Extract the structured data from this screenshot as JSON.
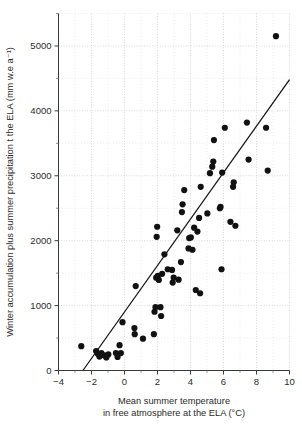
{
  "chart_data": {
    "type": "scatter",
    "title": "",
    "subtitle": "",
    "xlabel": "Mean summer temperature in free atmosphere at the ELA (°C)",
    "xlabel_line1": "Mean summer temperature",
    "xlabel_line2": "in free atmosphere at the ELA (°C)",
    "ylabel": "Winter accumulation plus summer precipitation t the ELA (mm w.e a⁻¹)",
    "xlim": [
      -4,
      10
    ],
    "ylim": [
      0,
      5500
    ],
    "x_ticks": [
      -4,
      -2,
      0,
      2,
      4,
      6,
      8,
      10
    ],
    "x_tick_labels": [
      "−4",
      "−2",
      "0",
      "2",
      "4",
      "6",
      "8",
      "10"
    ],
    "x_minor_ticks": [
      -3,
      -1,
      1,
      3,
      5,
      7,
      9
    ],
    "y_ticks": [
      0,
      1000,
      2000,
      3000,
      4000,
      5000
    ],
    "y_tick_labels": [
      "0",
      "1000",
      "2000",
      "3000",
      "4000",
      "5000"
    ],
    "y_minor_ticks": [
      500,
      1500,
      2500,
      3500,
      4500,
      5500
    ],
    "grid": true,
    "grid_style": "dotted",
    "legend": "none",
    "marker": "filled-circle",
    "marker_color": "#111111",
    "marker_size_px": 3.1,
    "points": [
      {
        "x": -2.62,
        "y": 375
      },
      {
        "x": -1.72,
        "y": 300
      },
      {
        "x": -1.62,
        "y": 258
      },
      {
        "x": -1.52,
        "y": 215
      },
      {
        "x": -1.4,
        "y": 268
      },
      {
        "x": -1.22,
        "y": 232
      },
      {
        "x": -1.1,
        "y": 200
      },
      {
        "x": -0.98,
        "y": 248
      },
      {
        "x": -0.52,
        "y": 268
      },
      {
        "x": -0.42,
        "y": 208
      },
      {
        "x": -0.3,
        "y": 390
      },
      {
        "x": -0.22,
        "y": 268
      },
      {
        "x": -0.12,
        "y": 745
      },
      {
        "x": 0.6,
        "y": 655
      },
      {
        "x": 0.62,
        "y": 560
      },
      {
        "x": 0.68,
        "y": 1300
      },
      {
        "x": 1.12,
        "y": 490
      },
      {
        "x": 1.78,
        "y": 560
      },
      {
        "x": 1.82,
        "y": 905
      },
      {
        "x": 1.88,
        "y": 975
      },
      {
        "x": 1.92,
        "y": 1430
      },
      {
        "x": 1.95,
        "y": 2060
      },
      {
        "x": 1.98,
        "y": 2215
      },
      {
        "x": 2.02,
        "y": 1460
      },
      {
        "x": 2.08,
        "y": 1395
      },
      {
        "x": 2.18,
        "y": 975
      },
      {
        "x": 2.22,
        "y": 840
      },
      {
        "x": 2.28,
        "y": 1490
      },
      {
        "x": 2.42,
        "y": 1790
      },
      {
        "x": 2.62,
        "y": 1560
      },
      {
        "x": 2.88,
        "y": 1550
      },
      {
        "x": 2.92,
        "y": 1355
      },
      {
        "x": 2.98,
        "y": 1430
      },
      {
        "x": 3.2,
        "y": 2160
      },
      {
        "x": 3.28,
        "y": 1400
      },
      {
        "x": 3.42,
        "y": 1670
      },
      {
        "x": 3.48,
        "y": 2440
      },
      {
        "x": 3.52,
        "y": 2560
      },
      {
        "x": 3.62,
        "y": 2780
      },
      {
        "x": 3.88,
        "y": 1880
      },
      {
        "x": 3.92,
        "y": 2040
      },
      {
        "x": 4.02,
        "y": 2050
      },
      {
        "x": 4.12,
        "y": 1860
      },
      {
        "x": 4.22,
        "y": 2200
      },
      {
        "x": 4.32,
        "y": 1240
      },
      {
        "x": 4.42,
        "y": 2140
      },
      {
        "x": 4.52,
        "y": 2350
      },
      {
        "x": 4.58,
        "y": 1190
      },
      {
        "x": 4.62,
        "y": 2830
      },
      {
        "x": 5.02,
        "y": 2420
      },
      {
        "x": 5.18,
        "y": 3040
      },
      {
        "x": 5.32,
        "y": 3140
      },
      {
        "x": 5.38,
        "y": 3220
      },
      {
        "x": 5.42,
        "y": 3550
      },
      {
        "x": 5.78,
        "y": 2500
      },
      {
        "x": 5.82,
        "y": 2520
      },
      {
        "x": 5.88,
        "y": 1560
      },
      {
        "x": 5.92,
        "y": 3050
      },
      {
        "x": 6.08,
        "y": 3740
      },
      {
        "x": 6.42,
        "y": 2290
      },
      {
        "x": 6.58,
        "y": 2830
      },
      {
        "x": 6.62,
        "y": 2900
      },
      {
        "x": 6.72,
        "y": 2230
      },
      {
        "x": 7.42,
        "y": 3820
      },
      {
        "x": 7.52,
        "y": 3250
      },
      {
        "x": 8.58,
        "y": 3740
      },
      {
        "x": 8.68,
        "y": 3080
      },
      {
        "x": 9.18,
        "y": 5150
      }
    ],
    "fit_line": {
      "label": "",
      "x_start": -2.52,
      "y_start": 0,
      "x_end": 10.0,
      "y_end": 4480
    }
  }
}
